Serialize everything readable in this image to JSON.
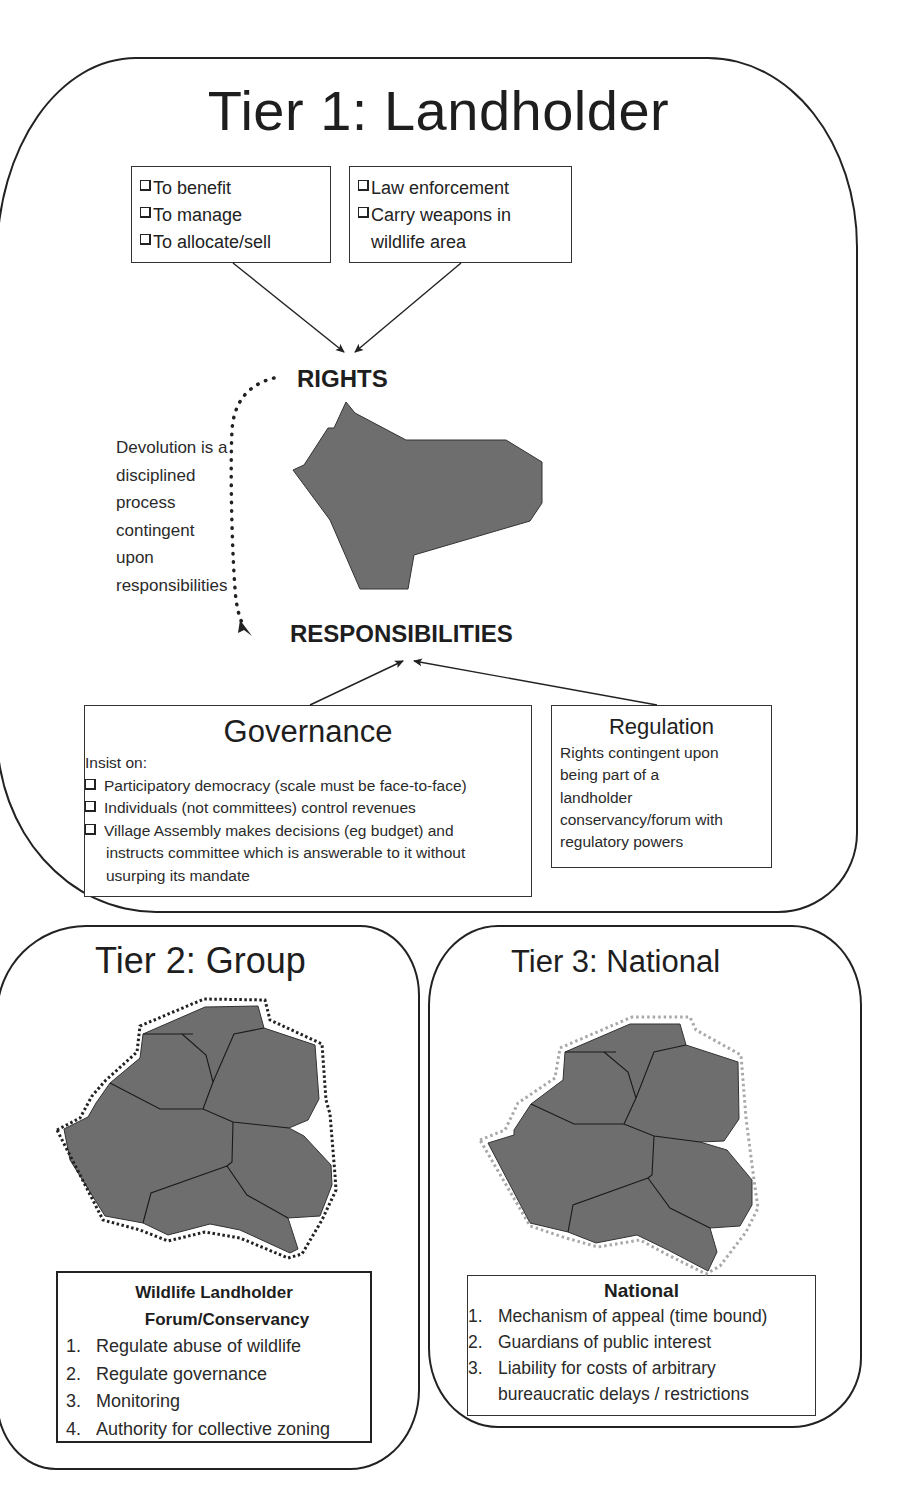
{
  "tier1": {
    "title": "Tier 1: Landholder",
    "rights_box_left": {
      "items": [
        "To benefit",
        "To manage",
        "To allocate/sell"
      ]
    },
    "rights_box_right": {
      "items": [
        "Law enforcement",
        "Carry weapons in",
        "wildlife area"
      ]
    },
    "rights_label": "RIGHTS",
    "responsibilities_label": "RESPONSIBILITIES",
    "devolution_note": [
      "Devolution is a",
      "disciplined",
      "process",
      "contingent",
      "upon",
      "responsibilities"
    ],
    "governance": {
      "title": "Governance",
      "intro": "Insist on:",
      "items": [
        "Participatory democracy (scale must be face-to-face)",
        "Individuals (not committees) control revenues",
        "Village Assembly makes decisions (eg budget) and"
      ],
      "item3_continuation": [
        "instructs committee which is answerable to it without",
        "usurping its mandate"
      ]
    },
    "regulation": {
      "title": "Regulation",
      "text_lines": [
        "Rights contingent upon",
        "being part of a",
        "landholder",
        "conservancy/forum with",
        "regulatory powers"
      ]
    }
  },
  "tier2": {
    "title": "Tier 2: Group",
    "forum": {
      "title_line1": "Wildlife Landholder",
      "title_line2": "Forum/Conservancy",
      "items": [
        {
          "num": "1.",
          "text": "Regulate abuse of wildlife"
        },
        {
          "num": "2.",
          "text": "Regulate governance"
        },
        {
          "num": "3.",
          "text": "Monitoring"
        },
        {
          "num": "4.",
          "text": "Authority for collective zoning"
        }
      ]
    }
  },
  "tier3": {
    "title": "Tier 3: National",
    "national": {
      "title": "National",
      "items": [
        {
          "num": "1.",
          "text": "Mechanism of appeal (time bound)"
        },
        {
          "num": "2.",
          "text": "Guardians of public interest"
        },
        {
          "num": "3.",
          "text": "Liability for costs of arbitrary"
        }
      ],
      "item3_continuation": "bureaucratic delays / restrictions"
    }
  },
  "colors": {
    "land_fill": "#6e6e6e",
    "outline": "#222222",
    "tier2_boundary": "#222222",
    "tier3_boundary": "#aaaaaa"
  }
}
